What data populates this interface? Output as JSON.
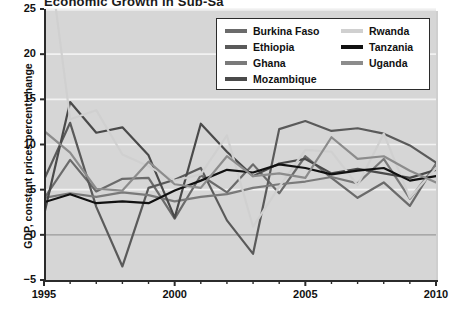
{
  "title": "Economic Growth in Sub-Sa",
  "axes": {
    "ylabel": "GDP, constant prices percent change",
    "yticks": [
      "-5",
      "0",
      "5",
      "10",
      "15",
      "20",
      "25"
    ],
    "xticks": [
      "1995",
      "2000",
      "2005",
      "2010"
    ]
  },
  "legend": {
    "items": [
      {
        "label": "Burkina Faso",
        "color": "#6b6b6b"
      },
      {
        "label": "Ethiopia",
        "color": "#5a5a5a"
      },
      {
        "label": "Ghana",
        "color": "#7a7a7a"
      },
      {
        "label": "Mozambique",
        "color": "#4a4a4a"
      },
      {
        "label": "Rwanda",
        "color": "#d0d0d0"
      },
      {
        "label": "Tanzania",
        "color": "#111111"
      },
      {
        "label": "Uganda",
        "color": "#8c8c8c"
      }
    ]
  },
  "chart_data": {
    "type": "line",
    "title": "Economic Growth in Sub-Sa",
    "xlabel": "",
    "ylabel": "GDP, constant prices percent change",
    "xlim": [
      1995,
      2010
    ],
    "ylim": [
      -5,
      25
    ],
    "grid": true,
    "legend_position": "top-right",
    "x": [
      1995,
      1996,
      1997,
      1998,
      1999,
      2000,
      2001,
      2002,
      2003,
      2004,
      2005,
      2006,
      2007,
      2008,
      2009,
      2010
    ],
    "series": [
      {
        "name": "Burkina Faso",
        "color": "#6b6b6b",
        "values": [
          4.0,
          8.3,
          4.8,
          6.2,
          6.3,
          1.8,
          6.6,
          4.7,
          7.8,
          4.6,
          8.7,
          6.3,
          4.1,
          5.8,
          3.2,
          7.9
        ]
      },
      {
        "name": "Ethiopia",
        "color": "#5a5a5a",
        "values": [
          6.1,
          12.4,
          3.1,
          -3.5,
          5.2,
          6.1,
          7.4,
          1.6,
          -2.1,
          11.7,
          12.6,
          11.5,
          11.8,
          11.2,
          9.9,
          8.0
        ]
      },
      {
        "name": "Ghana",
        "color": "#7a7a7a",
        "values": [
          4.1,
          4.6,
          4.2,
          4.7,
          4.4,
          3.7,
          4.2,
          4.5,
          5.2,
          5.6,
          5.9,
          6.4,
          5.7,
          8.4,
          4.0,
          7.7
        ]
      },
      {
        "name": "Mozambique",
        "color": "#4a4a4a",
        "values": [
          2.2,
          14.7,
          11.3,
          11.9,
          8.8,
          1.9,
          12.3,
          9.2,
          6.5,
          7.9,
          8.4,
          6.8,
          7.3,
          6.8,
          6.3,
          7.2
        ]
      },
      {
        "name": "Rwanda",
        "color": "#d0d0d0",
        "values": [
          35.2,
          12.8,
          13.8,
          8.9,
          7.6,
          6.0,
          6.7,
          11.0,
          0.9,
          5.3,
          9.4,
          9.2,
          5.5,
          11.2,
          4.1,
          7.4
        ]
      },
      {
        "name": "Tanzania",
        "color": "#111111",
        "values": [
          3.6,
          4.5,
          3.5,
          3.7,
          3.5,
          4.9,
          6.0,
          7.2,
          6.9,
          7.8,
          7.4,
          6.7,
          7.1,
          7.4,
          6.0,
          6.5
        ]
      },
      {
        "name": "Uganda",
        "color": "#8c8c8c",
        "values": [
          11.5,
          9.1,
          5.1,
          4.9,
          8.1,
          5.6,
          5.2,
          8.7,
          6.5,
          6.8,
          6.3,
          10.8,
          8.4,
          8.7,
          7.1,
          5.8
        ]
      }
    ]
  }
}
